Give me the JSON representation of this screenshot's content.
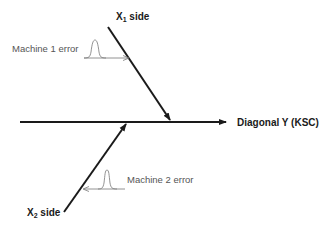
{
  "diagram": {
    "type": "fishbone",
    "x1_label": {
      "main": "X",
      "sub": "1",
      "rest": " side"
    },
    "x2_label": {
      "main": "X",
      "sub": "2",
      "rest": " side"
    },
    "axis_label": "Diagonal Y (KSC)",
    "machine1_label": "Machine 1 error",
    "machine2_label": "Machine 2 error",
    "colors": {
      "line": "#1a1a1a",
      "annotation": "#666666",
      "background": "#ffffff"
    }
  }
}
